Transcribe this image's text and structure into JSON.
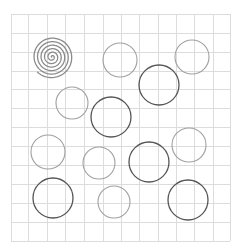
{
  "canvas": {
    "width": 243,
    "height": 246,
    "background": "#ffffff"
  },
  "grid": {
    "x_lines": [
      11,
      28,
      47,
      65,
      84,
      103,
      121,
      139,
      158,
      176,
      194,
      213,
      230
    ],
    "y_lines": [
      14,
      33,
      52,
      71,
      89,
      108,
      127,
      146,
      165,
      184,
      203,
      222,
      241
    ],
    "color": "#dcdcdc"
  },
  "spiral": {
    "cx": 52,
    "cy": 57,
    "r": 21,
    "turns": 6,
    "color": "#8a8a8a",
    "stroke_width": 1.3
  },
  "circles": [
    {
      "cx": 120,
      "cy": 60,
      "r": 17,
      "shade": "light"
    },
    {
      "cx": 192,
      "cy": 57,
      "r": 17,
      "shade": "light"
    },
    {
      "cx": 159,
      "cy": 85,
      "r": 20,
      "shade": "dark"
    },
    {
      "cx": 72,
      "cy": 103,
      "r": 16,
      "shade": "light"
    },
    {
      "cx": 111,
      "cy": 117,
      "r": 20,
      "shade": "dark"
    },
    {
      "cx": 48,
      "cy": 152,
      "r": 17,
      "shade": "light"
    },
    {
      "cx": 99,
      "cy": 163,
      "r": 16,
      "shade": "light"
    },
    {
      "cx": 149,
      "cy": 162,
      "r": 20,
      "shade": "dark"
    },
    {
      "cx": 189,
      "cy": 145,
      "r": 17,
      "shade": "light"
    },
    {
      "cx": 53,
      "cy": 198,
      "r": 20,
      "shade": "dark"
    },
    {
      "cx": 114,
      "cy": 202,
      "r": 16,
      "shade": "light"
    },
    {
      "cx": 188,
      "cy": 200,
      "r": 20,
      "shade": "dark"
    }
  ],
  "colors": {
    "light": "#a0a0a0",
    "dark": "#555555"
  }
}
